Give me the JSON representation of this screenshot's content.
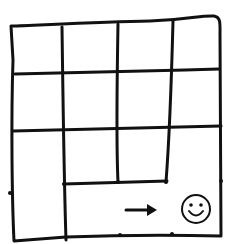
{
  "diagram": {
    "stroke_color": "#111111",
    "background": "#ffffff",
    "outer_frame": "M11,26 C40,25 100,22 150,21 C190,20 200,15 214,16 C221,17 220,24 220,35 L221,236 C180,235 120,235 66,237 L14,241 C12,200 11,120 13,60 L11,26",
    "grid_paths": [
      {
        "name": "horizontal-line-1",
        "d": "M15,74 C80,72 150,71 219,69"
      },
      {
        "name": "horizontal-line-2",
        "d": "M13,131 C80,129 150,128 221,126"
      },
      {
        "name": "horizontal-line-3-partial",
        "d": "M64,184 C100,183 140,182 167,181"
      },
      {
        "name": "vertical-line-1",
        "d": "M62,27 C63,100 64,180 66,240"
      },
      {
        "name": "vertical-line-2",
        "d": "M118,24 C117,80 116,140 118,182"
      },
      {
        "name": "vertical-line-3",
        "d": "M173,21 C172,60 170,130 166,182"
      }
    ],
    "tick_dots": [
      {
        "x": 10,
        "y": 193
      },
      {
        "x": 221,
        "y": 181
      },
      {
        "x": 120,
        "y": 235
      },
      {
        "x": 172,
        "y": 234
      },
      {
        "x": 64,
        "y": 184
      },
      {
        "x": 118,
        "y": 182
      },
      {
        "x": 166,
        "y": 182
      }
    ],
    "arrow": {
      "label": "right-arrow",
      "x1": 126,
      "y1": 210,
      "x2": 156,
      "y2": 210
    },
    "smiley": {
      "label": "smiley-face",
      "cx": 196,
      "cy": 209,
      "r": 14
    }
  }
}
